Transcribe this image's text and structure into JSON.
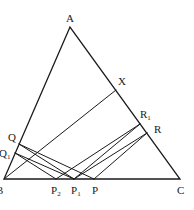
{
  "diagram": {
    "type": "geometry-triangle",
    "stroke_color": "#1a1a1a",
    "background": "#ffffff",
    "points": {
      "A": {
        "label": "A",
        "sub": "",
        "x": 70,
        "y": 27,
        "lx": 66,
        "ly": 22
      },
      "B": {
        "label": "B",
        "sub": "",
        "x": 4,
        "y": 179,
        "lx": -4,
        "ly": 194
      },
      "C": {
        "label": "C",
        "sub": "",
        "x": 180,
        "y": 179,
        "lx": 177,
        "ly": 194
      },
      "X": {
        "label": "X",
        "sub": "",
        "x": 116,
        "y": 90,
        "lx": 118,
        "ly": 85
      },
      "R1": {
        "label": "R",
        "sub": "1",
        "x": 140,
        "y": 124,
        "lx": 140,
        "ly": 118
      },
      "R": {
        "label": "R",
        "sub": "",
        "x": 147,
        "y": 133,
        "lx": 154,
        "ly": 133
      },
      "Q": {
        "label": "Q",
        "sub": "",
        "x": 19,
        "y": 144,
        "lx": 8,
        "ly": 141
      },
      "Q1": {
        "label": "Q",
        "sub": "1",
        "x": 15,
        "y": 153,
        "lx": -1,
        "ly": 157
      },
      "P2": {
        "label": "P",
        "sub": "2",
        "x": 56,
        "y": 179,
        "lx": 51,
        "ly": 194
      },
      "P1": {
        "label": "P",
        "sub": "1",
        "x": 74,
        "y": 179,
        "lx": 71,
        "ly": 194
      },
      "P": {
        "label": "P",
        "sub": "",
        "x": 94,
        "y": 179,
        "lx": 92,
        "ly": 194
      }
    },
    "triangle": [
      "A",
      "B",
      "C"
    ],
    "segments": [
      [
        "B",
        "X"
      ],
      [
        "Q",
        "P"
      ],
      [
        "Q",
        "P1"
      ],
      [
        "Q1",
        "P1"
      ],
      [
        "Q1",
        "P2"
      ],
      [
        "P2",
        "R1"
      ],
      [
        "P1",
        "R1"
      ],
      [
        "P1",
        "R"
      ],
      [
        "P",
        "R"
      ]
    ]
  }
}
